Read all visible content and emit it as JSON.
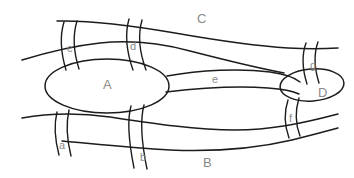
{
  "diagram": {
    "canvas": {
      "width": 354,
      "height": 178
    },
    "colors": {
      "background": "#ffffff",
      "stroke": "#1c1c1c",
      "label": "#8a8a8a"
    },
    "regions": [
      {
        "id": "A",
        "label": "A",
        "shape": "ellipse",
        "x": 107,
        "y": 84,
        "note": "large central ellipse"
      },
      {
        "id": "B",
        "label": "B",
        "shape": "band",
        "x": 207,
        "y": 162,
        "note": "lower band region"
      },
      {
        "id": "C",
        "label": "C",
        "shape": "band",
        "x": 201,
        "y": 18,
        "note": "upper band region"
      },
      {
        "id": "D",
        "label": "D",
        "shape": "ellipse",
        "x": 322,
        "y": 92,
        "note": "small right ellipse"
      }
    ],
    "passages": [
      {
        "id": "a",
        "label": "a",
        "x": 62,
        "y": 146,
        "note": "lower-left gate between A and B"
      },
      {
        "id": "b",
        "label": "b",
        "x": 143,
        "y": 158,
        "note": "lower-middle gate between A and B"
      },
      {
        "id": "c",
        "label": "c",
        "x": 70,
        "y": 49,
        "note": "upper-left gate between A and C"
      },
      {
        "id": "d",
        "label": "d",
        "x": 133,
        "y": 47,
        "note": "upper-middle gate between A and C"
      },
      {
        "id": "e",
        "label": "e",
        "x": 215,
        "y": 80,
        "note": "corridor linking A and D"
      },
      {
        "id": "f",
        "label": "f",
        "x": 292,
        "y": 119,
        "note": "lower-right gate between D and B"
      },
      {
        "id": "g",
        "label": "g",
        "x": 313,
        "y": 66,
        "note": "upper-right gate between D and C"
      }
    ]
  }
}
